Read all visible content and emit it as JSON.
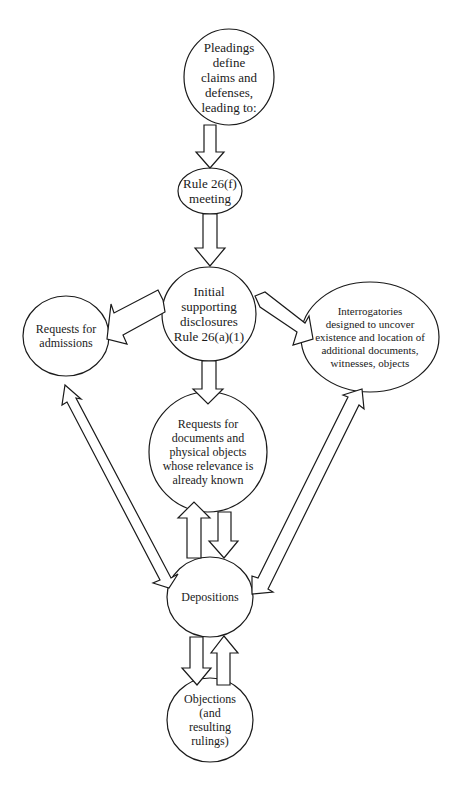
{
  "diagram": {
    "title": "",
    "colors": {
      "stroke": "#1a1a1a",
      "fill": "#ffffff",
      "background": "#ffffff"
    },
    "nodes": {
      "pleadings": {
        "label": "Pleadings\ndefine\nclaims and\ndefenses,\nleading to:"
      },
      "rule26f": {
        "label": "Rule 26(f)\nmeeting"
      },
      "initial": {
        "label": "Initial\nsupporting\ndisclosures\nRule 26(a)(1)"
      },
      "admissions": {
        "label": "Requests for\nadmissions"
      },
      "interrogatories": {
        "label": "Interrogatories\ndesigned to uncover\nexistence and location of\nadditional documents,\nwitnesses, objects"
      },
      "documents": {
        "label": "Requests for\ndocuments and\nphysical objects\nwhose relevance is\nalready known"
      },
      "depositions": {
        "label": "Depositions"
      },
      "objections": {
        "label": "Objections\n(and\nresulting\nrulings)"
      }
    },
    "edges": [
      {
        "from": "Pleadings define claims and defenses",
        "to": "Rule 26(f) meeting",
        "direction": "one-way"
      },
      {
        "from": "Rule 26(f) meeting",
        "to": "Initial supporting disclosures Rule 26(a)(1)",
        "direction": "one-way"
      },
      {
        "from": "Initial supporting disclosures Rule 26(a)(1)",
        "to": "Requests for admissions",
        "direction": "one-way"
      },
      {
        "from": "Initial supporting disclosures Rule 26(a)(1)",
        "to": "Interrogatories",
        "direction": "one-way"
      },
      {
        "from": "Initial supporting disclosures Rule 26(a)(1)",
        "to": "Requests for documents and physical objects",
        "direction": "one-way"
      },
      {
        "from": "Requests for admissions",
        "to": "Depositions",
        "direction": "two-way"
      },
      {
        "from": "Interrogatories",
        "to": "Depositions",
        "direction": "two-way"
      },
      {
        "from": "Requests for documents and physical objects",
        "to": "Depositions",
        "direction": "two-way (pair of arrows)"
      },
      {
        "from": "Depositions",
        "to": "Objections (and resulting rulings)",
        "direction": "two-way (pair of arrows)"
      }
    ]
  }
}
